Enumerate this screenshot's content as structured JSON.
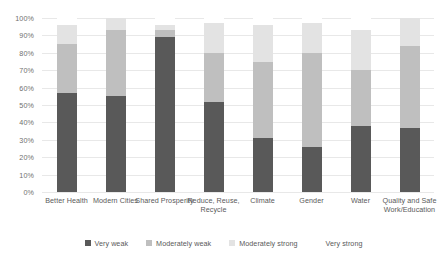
{
  "chart_data": {
    "type": "bar",
    "subtype": "stacked-vertical",
    "title": "",
    "xlabel": "",
    "ylabel": "",
    "ylim": [
      0,
      100
    ],
    "y_ticks": [
      "0%",
      "10%",
      "20%",
      "30%",
      "40%",
      "50%",
      "60%",
      "70%",
      "80%",
      "90%",
      "100%"
    ],
    "y_tick_values": [
      0,
      10,
      20,
      30,
      40,
      50,
      60,
      70,
      80,
      90,
      100
    ],
    "grid": true,
    "legend_position": "bottom",
    "categories": [
      "Better Health",
      "Modern Cities",
      "Shared Prosperity",
      "Reduce, Reuse, Recycle",
      "Climate",
      "Gender",
      "Water",
      "Quality and Safe Work/Education"
    ],
    "series": [
      {
        "name": "Very weak",
        "color": "#595959",
        "values": [
          57,
          55,
          89,
          52,
          31,
          26,
          38,
          37
        ]
      },
      {
        "name": "Moderately weak",
        "color": "#bfbfbf",
        "values": [
          28,
          38,
          4,
          28,
          44,
          54,
          32,
          47
        ]
      },
      {
        "name": "Moderately strong",
        "color": "#e3e3e3",
        "values": [
          11,
          7,
          3,
          17,
          21,
          17,
          23,
          16
        ]
      },
      {
        "name": "Very strong",
        "color": "#ffffff",
        "values": [
          4,
          0,
          4,
          3,
          4,
          3,
          7,
          0
        ]
      }
    ],
    "totals_visible": [
      96,
      100,
      96,
      97,
      96,
      97,
      93,
      100
    ]
  },
  "legend": {
    "items": [
      {
        "label": "Very weak",
        "color": "#595959"
      },
      {
        "label": "Moderately weak",
        "color": "#bfbfbf"
      },
      {
        "label": "Moderately strong",
        "color": "#e3e3e3"
      },
      {
        "label": "Very strong",
        "color": "#ffffff"
      }
    ]
  }
}
